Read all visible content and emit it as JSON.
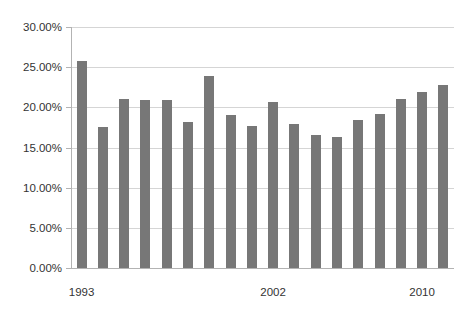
{
  "chart_data": {
    "type": "bar",
    "title": "",
    "subtitle": "",
    "xlabel": "",
    "ylabel": "",
    "grid": true,
    "legend": false,
    "legend_position": "none",
    "bar_color": "#777777",
    "gridline_color": "#d5d5d5",
    "axis_color": "#b3b3b3",
    "ylim": [
      0,
      30
    ],
    "yticks": [
      0,
      5,
      10,
      15,
      20,
      25,
      30
    ],
    "ytick_labels": [
      "0.00%",
      "5.00%",
      "10.00%",
      "15.00%",
      "20.00%",
      "25.00%",
      "30.00%"
    ],
    "categories": [
      "1993",
      "1994",
      "1995",
      "1996",
      "1997",
      "1998",
      "1999",
      "2000",
      "2001",
      "2002",
      "2003",
      "2004",
      "2005",
      "2006",
      "2007",
      "2008",
      "2009",
      "2010"
    ],
    "visible_xtick_labels": [
      {
        "category": "1993",
        "index": 0,
        "label": "1993"
      },
      {
        "category": "2002",
        "index": 9,
        "label": "2002"
      },
      {
        "category": "2010",
        "index": 16,
        "label": "2010"
      }
    ],
    "values": [
      25.8,
      17.5,
      21.0,
      20.9,
      20.9,
      18.2,
      23.9,
      19.0,
      17.7,
      20.7,
      17.9,
      16.5,
      16.3,
      18.4,
      19.2,
      21.0,
      21.9,
      22.8
    ],
    "value_unit": "percent",
    "bar_count": 18
  }
}
